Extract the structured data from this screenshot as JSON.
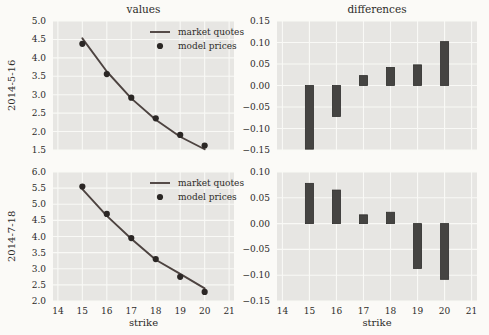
{
  "figure": {
    "background": "#fbfaf7",
    "axes_background": "#e7e6e3",
    "grid_color": "#f9f9f6",
    "text_color": "#2d2b29",
    "line_color": "#4d4340",
    "dot_color": "#2b2725",
    "bar_color": "#454442",
    "bar_edge_color": "#2f2e2c"
  },
  "chart_data": [
    {
      "id": "values-2014-5-16",
      "type": "line",
      "title": "values",
      "ylabel": "2014-5-16",
      "xlabel": "",
      "x": [
        15,
        16,
        17,
        18,
        19,
        20
      ],
      "xlim": [
        13.8,
        21.2
      ],
      "xticks": [
        14,
        15,
        16,
        17,
        18,
        19,
        20,
        21
      ],
      "xticklabels": [],
      "ylim": [
        1.5,
        5.0
      ],
      "yticks": [
        1.5,
        2.0,
        2.5,
        3.0,
        3.5,
        4.0,
        4.5,
        5.0
      ],
      "yticklabels": [
        "1.5",
        "2.0",
        "2.5",
        "3.0",
        "3.5",
        "4.0",
        "4.5",
        "5.0"
      ],
      "grid": true,
      "legend": true,
      "legend_position": "upper right",
      "series": [
        {
          "name": "market quotes",
          "style": "line",
          "values": [
            4.53,
            3.63,
            2.9,
            2.32,
            1.86,
            1.52
          ]
        },
        {
          "name": "model prices",
          "style": "dots",
          "values": [
            4.38,
            3.56,
            2.92,
            2.36,
            1.91,
            1.62
          ]
        }
      ]
    },
    {
      "id": "differences-2014-5-16",
      "type": "bar",
      "title": "differences",
      "ylabel": "",
      "xlabel": "",
      "x": [
        15,
        16,
        17,
        18,
        19,
        20
      ],
      "xlim": [
        13.8,
        21.2
      ],
      "xticks": [
        14,
        15,
        16,
        17,
        18,
        19,
        20,
        21
      ],
      "xticklabels": [],
      "ylim": [
        -0.15,
        0.15
      ],
      "yticks": [
        -0.15,
        -0.1,
        -0.05,
        0.0,
        0.05,
        0.1,
        0.15
      ],
      "yticklabels": [
        "−0.15",
        "−0.10",
        "−0.05",
        "0.00",
        "0.05",
        "0.10",
        "0.15"
      ],
      "grid": true,
      "legend": false,
      "bar_width": 0.3,
      "values": [
        -0.148,
        -0.072,
        0.023,
        0.042,
        0.048,
        0.102
      ]
    },
    {
      "id": "values-2014-7-18",
      "type": "line",
      "title": "",
      "ylabel": "2014-7-18",
      "xlabel": "strike",
      "x": [
        15,
        16,
        17,
        18,
        19,
        20
      ],
      "xlim": [
        13.8,
        21.2
      ],
      "xticks": [
        14,
        15,
        16,
        17,
        18,
        19,
        20,
        21
      ],
      "xticklabels": [
        "14",
        "15",
        "16",
        "17",
        "18",
        "19",
        "20",
        "21"
      ],
      "ylim": [
        2.0,
        6.0
      ],
      "yticks": [
        2.0,
        2.5,
        3.0,
        3.5,
        4.0,
        4.5,
        5.0,
        5.5,
        6.0
      ],
      "yticklabels": [
        "2.0",
        "2.5",
        "3.0",
        "3.5",
        "4.0",
        "4.5",
        "5.0",
        "5.5",
        "6.0"
      ],
      "grid": true,
      "legend": true,
      "legend_position": "upper right",
      "series": [
        {
          "name": "market quotes",
          "style": "line",
          "values": [
            5.47,
            4.64,
            3.93,
            3.28,
            2.84,
            2.39
          ]
        },
        {
          "name": "model prices",
          "style": "dots",
          "values": [
            5.55,
            4.7,
            3.95,
            3.3,
            2.75,
            2.28
          ]
        }
      ]
    },
    {
      "id": "differences-2014-7-18",
      "type": "bar",
      "title": "",
      "ylabel": "",
      "xlabel": "strike",
      "x": [
        15,
        16,
        17,
        18,
        19,
        20
      ],
      "xlim": [
        13.8,
        21.2
      ],
      "xticks": [
        14,
        15,
        16,
        17,
        18,
        19,
        20,
        21
      ],
      "xticklabels": [
        "14",
        "15",
        "16",
        "17",
        "18",
        "19",
        "20",
        "21"
      ],
      "ylim": [
        -0.15,
        0.1
      ],
      "yticks": [
        -0.15,
        -0.1,
        -0.05,
        0.0,
        0.05,
        0.1
      ],
      "yticklabels": [
        "−0.15",
        "−0.10",
        "−0.05",
        "0.00",
        "0.05",
        "0.10"
      ],
      "grid": true,
      "legend": false,
      "bar_width": 0.3,
      "values": [
        0.078,
        0.065,
        0.017,
        0.022,
        -0.087,
        -0.108
      ]
    }
  ]
}
